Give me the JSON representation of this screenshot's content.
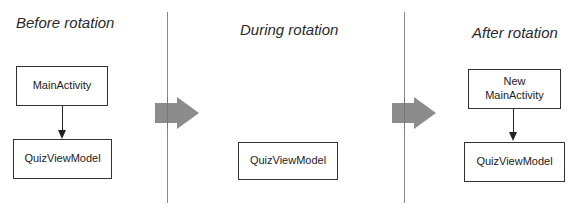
{
  "phases": [
    {
      "title": "Before rotation",
      "boxes": [
        "MainActivity",
        "QuizViewModel"
      ]
    },
    {
      "title": "During rotation",
      "boxes": [
        "QuizViewModel"
      ]
    },
    {
      "title": "After rotation",
      "boxes": [
        "New\nMainActivity",
        "QuizViewModel"
      ]
    }
  ],
  "colors": {
    "transition_arrow": "#8c8c8c",
    "divider": "#888888",
    "box_border": "#333333"
  }
}
